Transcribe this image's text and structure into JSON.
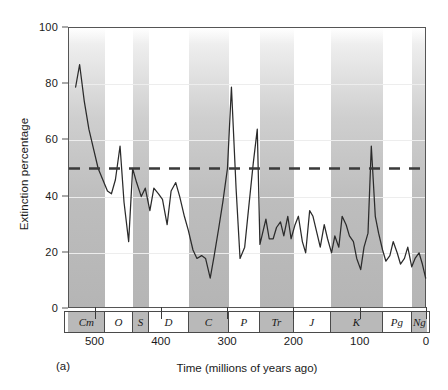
{
  "panel_label": "(a)",
  "axes": {
    "y_title": "Extinction percentage",
    "x_title": "Time (millions of years ago)",
    "y_ticks": [
      0,
      20,
      40,
      60,
      80,
      100
    ],
    "x_ticks": [
      500,
      400,
      300,
      200,
      100,
      0
    ]
  },
  "reference_line": {
    "value": 50,
    "style": "dashed",
    "color": "#3a3a3a"
  },
  "periods": [
    {
      "abbr": "Cm",
      "name": "Cambrian",
      "start": 541,
      "end": 485,
      "shaded": true
    },
    {
      "abbr": "O",
      "name": "Ordovician",
      "start": 485,
      "end": 444,
      "shaded": false
    },
    {
      "abbr": "S",
      "name": "Silurian",
      "start": 444,
      "end": 419,
      "shaded": true
    },
    {
      "abbr": "D",
      "name": "Devonian",
      "start": 419,
      "end": 359,
      "shaded": false
    },
    {
      "abbr": "C",
      "name": "Carboniferous",
      "start": 359,
      "end": 299,
      "shaded": true
    },
    {
      "abbr": "P",
      "name": "Permian",
      "start": 299,
      "end": 252,
      "shaded": false
    },
    {
      "abbr": "Tr",
      "name": "Triassic",
      "start": 252,
      "end": 201,
      "shaded": true
    },
    {
      "abbr": "J",
      "name": "Jurassic",
      "start": 201,
      "end": 145,
      "shaded": false
    },
    {
      "abbr": "K",
      "name": "Cretaceous",
      "start": 145,
      "end": 66,
      "shaded": true
    },
    {
      "abbr": "Pg",
      "name": "Paleogene",
      "start": 66,
      "end": 23,
      "shaded": false
    },
    {
      "abbr": "Ng",
      "name": "Neogene",
      "start": 23,
      "end": 0,
      "shaded": true
    }
  ],
  "chart_data": {
    "type": "line",
    "title": "",
    "xlabel": "Time (millions of years ago)",
    "ylabel": "Extinction percentage",
    "xlim": [
      540,
      0
    ],
    "ylim": [
      0,
      100
    ],
    "x_reversed": true,
    "grid": true,
    "legend": "none",
    "line_color": "#2b2b2b",
    "annotations": [
      "(a)"
    ],
    "series": [
      {
        "name": "Extinction percentage",
        "x": [
          530,
          524,
          517,
          510,
          503,
          496,
          489,
          482,
          476,
          470,
          463,
          457,
          450,
          444,
          438,
          431,
          425,
          418,
          412,
          405,
          399,
          392,
          386,
          379,
          373,
          366,
          360,
          353,
          347,
          340,
          334,
          327,
          321,
          314,
          308,
          301,
          295,
          288,
          282,
          275,
          269,
          262,
          256,
          252,
          248,
          243,
          238,
          232,
          227,
          221,
          216,
          210,
          205,
          199,
          194,
          188,
          183,
          177,
          172,
          166,
          161,
          155,
          150,
          144,
          139,
          133,
          128,
          122,
          117,
          111,
          106,
          100,
          95,
          89,
          84,
          78,
          73,
          67,
          62,
          56,
          51,
          45,
          40,
          34,
          29,
          23,
          18,
          12,
          7,
          2
        ],
        "y": [
          79,
          87,
          74,
          64,
          57,
          50,
          46,
          42,
          41,
          46,
          58,
          38,
          24,
          50,
          45,
          40,
          43,
          35,
          43,
          41,
          39,
          30,
          42,
          45,
          40,
          33,
          28,
          21,
          18,
          19,
          18,
          11,
          19,
          29,
          38,
          50,
          79,
          43,
          18,
          22,
          36,
          52,
          64,
          23,
          27,
          32,
          25,
          25,
          29,
          31,
          26,
          33,
          25,
          30,
          33,
          24,
          20,
          35,
          33,
          27,
          22,
          30,
          25,
          20,
          26,
          22,
          33,
          30,
          26,
          24,
          18,
          14,
          22,
          27,
          58,
          33,
          27,
          21,
          17,
          19,
          24,
          20,
          16,
          18,
          22,
          15,
          18,
          20,
          16,
          11
        ]
      }
    ]
  }
}
